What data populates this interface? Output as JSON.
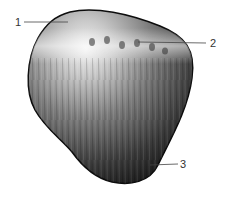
{
  "figure": {
    "fill_light": "#e6e6e6",
    "fill_mid": "#8a8a8a",
    "fill_dark": "#1a1a1a",
    "leader_color": "#444444"
  },
  "labels": [
    {
      "id": "1",
      "text": "1"
    },
    {
      "id": "2",
      "text": "2"
    },
    {
      "id": "3",
      "text": "3"
    }
  ]
}
